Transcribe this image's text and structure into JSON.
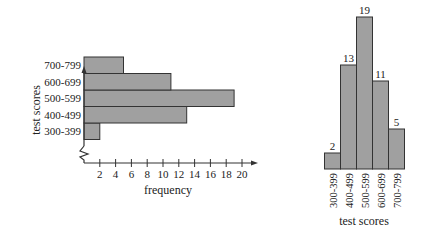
{
  "chart_data": [
    {
      "type": "bar",
      "orientation": "horizontal",
      "title": "",
      "categories": [
        "300-399",
        "400-499",
        "500-599",
        "600-699",
        "700-799"
      ],
      "values": [
        2,
        13,
        19,
        11,
        5
      ],
      "xlabel": "frequency",
      "ylabel": "test scores",
      "x_ticks": [
        2,
        4,
        6,
        8,
        10,
        12,
        14,
        16,
        18,
        20
      ],
      "xlim": [
        0,
        21
      ],
      "axis_break": true,
      "bar_color": "#a0a0a0",
      "grid": false
    },
    {
      "type": "bar",
      "orientation": "vertical",
      "title": "",
      "categories": [
        "300-399",
        "400-499",
        "500-599",
        "600-699",
        "700-799"
      ],
      "values": [
        2,
        13,
        19,
        11,
        5
      ],
      "data_labels": [
        "2",
        "13",
        "19",
        "11",
        "5"
      ],
      "xlabel": "test scores",
      "ylabel": "",
      "bar_color": "#a0a0a0",
      "grid": false
    }
  ]
}
